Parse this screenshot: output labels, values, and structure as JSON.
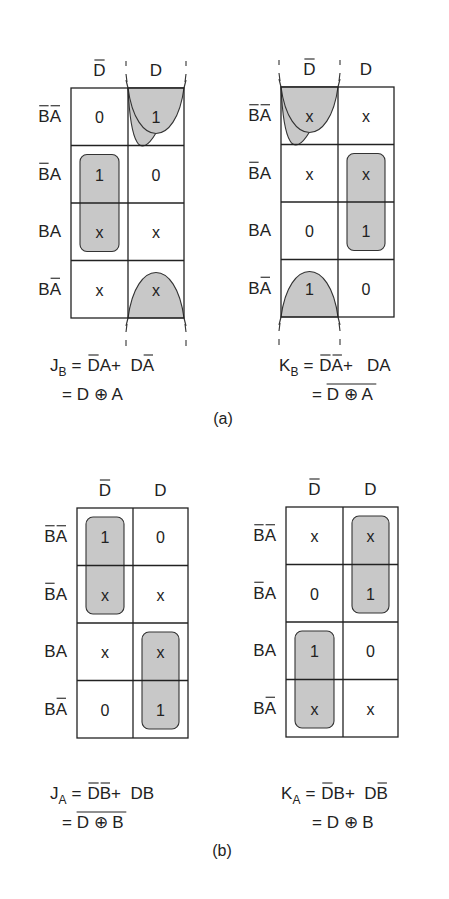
{
  "figure_a": {
    "caption": "(a)",
    "maps": [
      {
        "id": "JB",
        "col_headers": [
          {
            "label": "D",
            "negated": true
          },
          {
            "label": "D",
            "negated": false
          }
        ],
        "row_headers": [
          [
            {
              "l": "B",
              "n": true
            },
            {
              "l": "A",
              "n": true
            }
          ],
          [
            {
              "l": "B",
              "n": true
            },
            {
              "l": "A",
              "n": false
            }
          ],
          [
            {
              "l": "B",
              "n": false
            },
            {
              "l": "A",
              "n": false
            }
          ],
          [
            {
              "l": "B",
              "n": false
            },
            {
              "l": "A",
              "n": true
            }
          ]
        ],
        "cells": [
          [
            "0",
            "1"
          ],
          [
            "1",
            "0"
          ],
          [
            "x",
            "x"
          ],
          [
            "x",
            "x"
          ]
        ],
        "groups": [
          {
            "type": "rect",
            "col": 0,
            "rows": [
              1,
              2
            ]
          },
          {
            "type": "wrap",
            "col": 1,
            "rows": [
              0,
              3
            ]
          }
        ],
        "equation": {
          "lhs": "J",
          "lhs_sub": "B",
          "line1": [
            {
              "t": "D",
              "n": true
            },
            {
              "t": "A",
              "n": false
            },
            {
              "t": " + ",
              "n": false
            },
            {
              "t": "D",
              "n": false
            },
            {
              "t": "A",
              "n": true
            }
          ],
          "line2": "= D ⊕ A",
          "line2_negated": false
        }
      },
      {
        "id": "KB",
        "col_headers": [
          {
            "label": "D",
            "negated": true
          },
          {
            "label": "D",
            "negated": false
          }
        ],
        "row_headers": [
          [
            {
              "l": "B",
              "n": true
            },
            {
              "l": "A",
              "n": true
            }
          ],
          [
            {
              "l": "B",
              "n": true
            },
            {
              "l": "A",
              "n": false
            }
          ],
          [
            {
              "l": "B",
              "n": false
            },
            {
              "l": "A",
              "n": false
            }
          ],
          [
            {
              "l": "B",
              "n": false
            },
            {
              "l": "A",
              "n": true
            }
          ]
        ],
        "cells": [
          [
            "x",
            "x"
          ],
          [
            "x",
            "x"
          ],
          [
            "0",
            "1"
          ],
          [
            "1",
            "0"
          ]
        ],
        "groups": [
          {
            "type": "rect",
            "col": 1,
            "rows": [
              1,
              2
            ]
          },
          {
            "type": "wrap",
            "col": 0,
            "rows": [
              0,
              3
            ]
          }
        ],
        "equation": {
          "lhs": "K",
          "lhs_sub": "B",
          "line1": [
            {
              "t": "D",
              "n": true
            },
            {
              "t": "A",
              "n": true
            },
            {
              "t": "  + ",
              "n": false
            },
            {
              "t": "D",
              "n": false
            },
            {
              "t": "A",
              "n": false
            }
          ],
          "line2": "= D ⊕ A",
          "line2_negated": true
        }
      }
    ]
  },
  "figure_b": {
    "caption": "(b)",
    "maps": [
      {
        "id": "JA",
        "col_headers": [
          {
            "label": "D",
            "negated": true
          },
          {
            "label": "D",
            "negated": false
          }
        ],
        "row_headers": [
          [
            {
              "l": "B",
              "n": true
            },
            {
              "l": "A",
              "n": true
            }
          ],
          [
            {
              "l": "B",
              "n": true
            },
            {
              "l": "A",
              "n": false
            }
          ],
          [
            {
              "l": "B",
              "n": false
            },
            {
              "l": "A",
              "n": false
            }
          ],
          [
            {
              "l": "B",
              "n": false
            },
            {
              "l": "A",
              "n": true
            }
          ]
        ],
        "cells": [
          [
            "1",
            "0"
          ],
          [
            "x",
            "x"
          ],
          [
            "x",
            "x"
          ],
          [
            "0",
            "1"
          ]
        ],
        "groups": [
          {
            "type": "rect",
            "col": 0,
            "rows": [
              0,
              1
            ]
          },
          {
            "type": "rect",
            "col": 1,
            "rows": [
              2,
              3
            ]
          }
        ],
        "equation": {
          "lhs": "J",
          "lhs_sub": "A",
          "line1": [
            {
              "t": "D",
              "n": true
            },
            {
              "t": "B",
              "n": true
            },
            {
              "t": " + ",
              "n": false
            },
            {
              "t": "D",
              "n": false
            },
            {
              "t": "B",
              "n": false
            }
          ],
          "line2": "= D ⊕ B",
          "line2_negated": true
        }
      },
      {
        "id": "KA",
        "col_headers": [
          {
            "label": "D",
            "negated": true
          },
          {
            "label": "D",
            "negated": false
          }
        ],
        "row_headers": [
          [
            {
              "l": "B",
              "n": true
            },
            {
              "l": "A",
              "n": true
            }
          ],
          [
            {
              "l": "B",
              "n": true
            },
            {
              "l": "A",
              "n": false
            }
          ],
          [
            {
              "l": "B",
              "n": false
            },
            {
              "l": "A",
              "n": false
            }
          ],
          [
            {
              "l": "B",
              "n": false
            },
            {
              "l": "A",
              "n": true
            }
          ]
        ],
        "cells": [
          [
            "x",
            "x"
          ],
          [
            "0",
            "1"
          ],
          [
            "1",
            "0"
          ],
          [
            "x",
            "x"
          ]
        ],
        "groups": [
          {
            "type": "rect",
            "col": 1,
            "rows": [
              0,
              1
            ]
          },
          {
            "type": "rect",
            "col": 0,
            "rows": [
              2,
              3
            ]
          }
        ],
        "equation": {
          "lhs": "K",
          "lhs_sub": "A",
          "line1": [
            {
              "t": "D",
              "n": true
            },
            {
              "t": "B",
              "n": false
            },
            {
              "t": " + ",
              "n": false
            },
            {
              "t": "D",
              "n": false
            },
            {
              "t": "B",
              "n": true
            }
          ],
          "line2": "= D ⊕ B",
          "line2_negated": false
        }
      }
    ]
  },
  "colors": {
    "loop_fill": "#c8c8c8",
    "ink": "#222222"
  }
}
